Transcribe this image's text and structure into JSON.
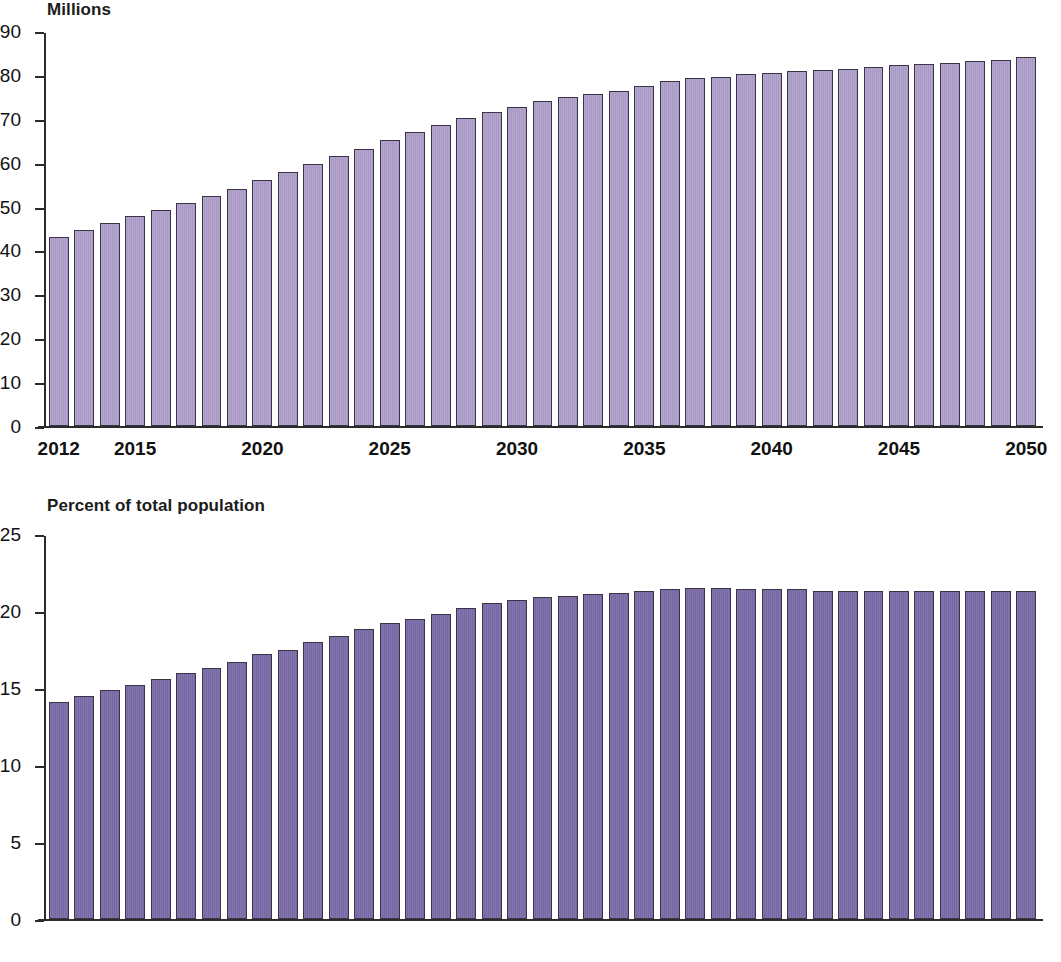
{
  "charts": {
    "millions": {
      "title": "Millions",
      "y_ticks": [
        0,
        10,
        20,
        30,
        40,
        50,
        60,
        70,
        80,
        90
      ],
      "x_tick_labels": [
        "2012",
        "2015",
        "2020",
        "2025",
        "2030",
        "2035",
        "2040",
        "2045",
        "2050"
      ],
      "bar_color": "#ab9cc8",
      "bar_outline": "#3b3446"
    },
    "percent": {
      "title": "Percent of total population",
      "y_ticks": [
        0,
        5,
        10,
        15,
        20,
        25
      ],
      "x_tick_labels": [
        "2012",
        "2015",
        "2020",
        "2025",
        "2030",
        "2035",
        "2040",
        "2045",
        "2050"
      ],
      "bar_color": "#7a6aa8",
      "bar_outline": "#3b3446"
    }
  },
  "chart_data": [
    {
      "type": "bar",
      "title": "Millions",
      "xlabel": "",
      "ylabel": "Millions",
      "ylim": [
        0,
        90
      ],
      "yticks": [
        0,
        10,
        20,
        30,
        40,
        50,
        60,
        70,
        80,
        90
      ],
      "grid": false,
      "legend": "none",
      "xtick_labels": [
        "2012",
        "2015",
        "2020",
        "2025",
        "2030",
        "2035",
        "2040",
        "2045",
        "2050"
      ],
      "categories": [
        "2012",
        "2013",
        "2014",
        "2015",
        "2016",
        "2017",
        "2018",
        "2019",
        "2020",
        "2021",
        "2022",
        "2023",
        "2024",
        "2025",
        "2026",
        "2027",
        "2028",
        "2029",
        "2030",
        "2031",
        "2032",
        "2033",
        "2034",
        "2035",
        "2036",
        "2037",
        "2038",
        "2039",
        "2040",
        "2041",
        "2042",
        "2043",
        "2044",
        "2045",
        "2046",
        "2047",
        "2048",
        "2049",
        "2050"
      ],
      "values": [
        43.1,
        44.7,
        46.2,
        47.8,
        49.2,
        50.9,
        52.5,
        54.1,
        56.1,
        57.8,
        59.7,
        61.6,
        63.2,
        65.1,
        67.0,
        68.6,
        70.1,
        71.5,
        72.8,
        74.1,
        74.9,
        75.7,
        76.4,
        77.5,
        78.6,
        79.2,
        79.6,
        80.1,
        80.5,
        80.8,
        81.2,
        81.4,
        81.8,
        82.2,
        82.5,
        82.8,
        83.2,
        83.5,
        84.1
      ]
    },
    {
      "type": "bar",
      "title": "Percent of total population",
      "xlabel": "",
      "ylabel": "Percent of total population",
      "ylim": [
        0,
        25
      ],
      "yticks": [
        0,
        5,
        10,
        15,
        20,
        25
      ],
      "grid": false,
      "legend": "none",
      "xtick_labels": [
        "2012",
        "2015",
        "2020",
        "2025",
        "2030",
        "2035",
        "2040",
        "2045",
        "2050"
      ],
      "categories": [
        "2012",
        "2013",
        "2014",
        "2015",
        "2016",
        "2017",
        "2018",
        "2019",
        "2020",
        "2021",
        "2022",
        "2023",
        "2024",
        "2025",
        "2026",
        "2027",
        "2028",
        "2029",
        "2030",
        "2031",
        "2032",
        "2033",
        "2034",
        "2035",
        "2036",
        "2037",
        "2038",
        "2039",
        "2040",
        "2041",
        "2042",
        "2043",
        "2044",
        "2045",
        "2046",
        "2047",
        "2048",
        "2049",
        "2050"
      ],
      "values": [
        14.1,
        14.5,
        14.9,
        15.2,
        15.6,
        16.0,
        16.3,
        16.7,
        17.2,
        17.5,
        18.0,
        18.4,
        18.8,
        19.2,
        19.5,
        19.8,
        20.2,
        20.5,
        20.7,
        20.9,
        21.0,
        21.1,
        21.2,
        21.3,
        21.4,
        21.5,
        21.5,
        21.4,
        21.4,
        21.4,
        21.3,
        21.3,
        21.3,
        21.3,
        21.3,
        21.3,
        21.3,
        21.3,
        21.3
      ]
    }
  ]
}
